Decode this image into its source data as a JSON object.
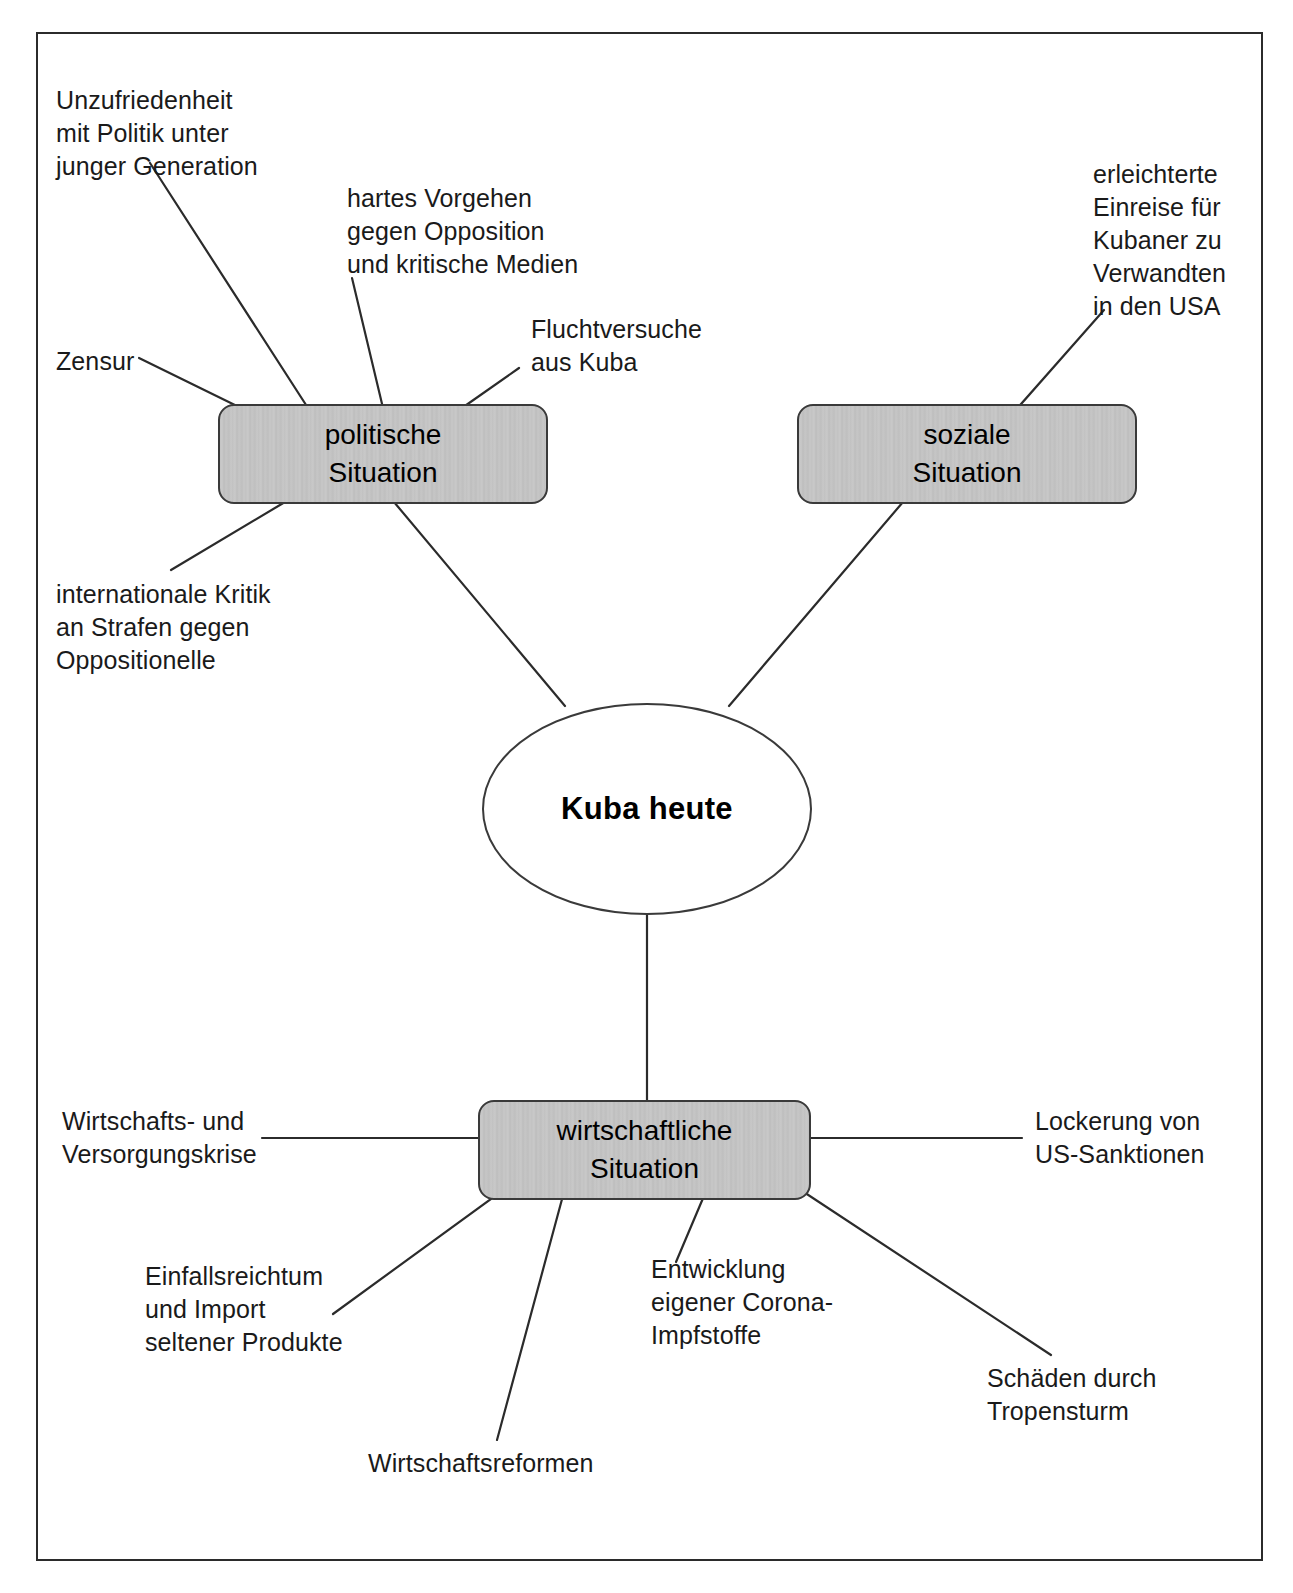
{
  "diagram": {
    "type": "mind-map",
    "language": "de",
    "center": {
      "label": "Kuba heute",
      "shape": "ellipse"
    },
    "branches": [
      {
        "id": "politische",
        "label_line1": "politische",
        "label_line2": "Situation",
        "shape": "rounded-rect",
        "leaves": [
          "Unzufriedenheit\nmit Politik unter\njunger Generation",
          "hartes Vorgehen\ngegen Opposition\nund kritische Medien",
          "Fluchtversuche\naus Kuba",
          "Zensur",
          "internationale Kritik\nan Strafen gegen\nOppositionelle"
        ]
      },
      {
        "id": "soziale",
        "label_line1": "soziale",
        "label_line2": "Situation",
        "shape": "rounded-rect",
        "leaves": [
          "erleichterte\nEinreise für\nKubaner zu\nVerwandten\nin den USA"
        ]
      },
      {
        "id": "wirtschaftliche",
        "label_line1": "wirtschaftliche",
        "label_line2": "Situation",
        "shape": "rounded-rect",
        "leaves": [
          "Wirtschafts- und\nVersorgungskrise",
          "Lockerung von\nUS-Sanktionen",
          "Einfallsreichtum\nund Import\nseltener Produkte",
          "Wirtschaftsreformen",
          "Entwicklung\neigener Corona-\nImpfstoffe",
          "Schäden durch\nTropensturm"
        ]
      }
    ],
    "colors": {
      "node_fill": "#c4c4c4",
      "node_border": "#3a3a3a",
      "line": "#2b2b2b",
      "text": "#1a1a1a",
      "background": "#ffffff"
    }
  },
  "labels": {
    "unzufriedenheit": "Unzufriedenheit\nmit Politik unter\njunger Generation",
    "hartes_vorgehen": "hartes Vorgehen\ngegen Opposition\nund kritische Medien",
    "fluchtversuche": "Fluchtversuche\naus Kuba",
    "zensur": "Zensur",
    "intl_kritik": "internationale Kritik\nan Strafen gegen\nOppositionelle",
    "erleichterte_einreise": "erleichterte\nEinreise für\nKubaner zu\nVerwandten\nin den USA",
    "wirtschaftskrise": "Wirtschafts- und\nVersorgungskrise",
    "lockerung": "Lockerung von\nUS-Sanktionen",
    "einfallsreichtum": "Einfallsreichtum\nund Import\nseltener Produkte",
    "wirtschaftsreformen": "Wirtschaftsreformen",
    "corona_impfstoffe": "Entwicklung\neigener Corona-\nImpfstoffe",
    "tropensturm": "Schäden durch\nTropensturm"
  },
  "nodes": {
    "politische_1": "politische",
    "politische_2": "Situation",
    "soziale_1": "soziale",
    "soziale_2": "Situation",
    "wirtschaftliche_1": "wirtschaftliche",
    "wirtschaftliche_2": "Situation",
    "center": "Kuba heute"
  }
}
